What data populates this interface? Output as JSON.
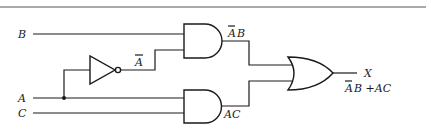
{
  "diagram": {
    "type": "logic-circuit",
    "inputs": [
      {
        "id": "B",
        "label": "B"
      },
      {
        "id": "A",
        "label": "A"
      },
      {
        "id": "C",
        "label": "C"
      }
    ],
    "gates": [
      {
        "id": "not1",
        "type": "NOT",
        "input": "A",
        "output_label": "A",
        "output_overbar": true
      },
      {
        "id": "and1",
        "type": "AND",
        "inputs": [
          "B",
          "not1"
        ],
        "output_label": "AB",
        "overbar_on": "A"
      },
      {
        "id": "and2",
        "type": "AND",
        "inputs": [
          "A",
          "C"
        ],
        "output_label": "AC"
      },
      {
        "id": "or1",
        "type": "OR",
        "inputs": [
          "and1",
          "and2"
        ]
      }
    ],
    "output": {
      "label": "X",
      "expression": "AB +AC",
      "expression_display": "ĀB + AC"
    },
    "colors": {
      "line": "#1a1a1a",
      "rule": "#555555",
      "background": "#ffffff"
    }
  },
  "labels": {
    "input_b": "B",
    "input_a": "A",
    "input_c": "C",
    "not_out_letter": "A",
    "and1_out_a": "A",
    "and1_out_b": "B",
    "and2_out": "AC",
    "output_x": "X",
    "expr_a": "A",
    "expr_rest": "B +AC"
  }
}
